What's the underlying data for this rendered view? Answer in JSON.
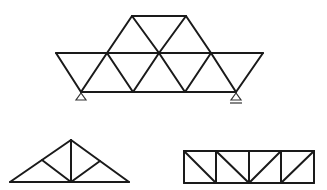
{
  "diagram": {
    "title": "",
    "stroke_color": "#1a1a1a",
    "support_color": "#333333",
    "background": "#ffffff",
    "trusses": [
      {
        "name": "warren-truss-with-supports",
        "members": [
          [
            56,
            53,
            263,
            53
          ],
          [
            132,
            16,
            186,
            16
          ],
          [
            81,
            92,
            236,
            92
          ],
          [
            56,
            53,
            81,
            92
          ],
          [
            81,
            92,
            107,
            53
          ],
          [
            107,
            53,
            133,
            92
          ],
          [
            133,
            92,
            159,
            53
          ],
          [
            159,
            53,
            185,
            92
          ],
          [
            185,
            92,
            211,
            53
          ],
          [
            211,
            53,
            236,
            92
          ],
          [
            236,
            92,
            263,
            53
          ],
          [
            107,
            53,
            132,
            16
          ],
          [
            132,
            16,
            159,
            53
          ],
          [
            159,
            53,
            186,
            16
          ],
          [
            186,
            16,
            211,
            53
          ]
        ],
        "supports": [
          {
            "type": "pin",
            "x": 81,
            "y": 92
          },
          {
            "type": "roller",
            "x": 236,
            "y": 92
          }
        ]
      },
      {
        "name": "roof-truss",
        "members": [
          [
            10,
            182,
            129,
            182
          ],
          [
            10,
            182,
            71,
            140
          ],
          [
            71,
            140,
            129,
            182
          ],
          [
            71,
            140,
            71,
            182
          ],
          [
            42,
            160,
            71,
            182
          ],
          [
            100,
            161,
            71,
            182
          ]
        ],
        "supports": []
      },
      {
        "name": "pratt-truss",
        "members": [
          [
            184,
            151,
            314,
            151
          ],
          [
            184,
            183,
            314,
            183
          ],
          [
            184,
            151,
            184,
            183
          ],
          [
            216,
            151,
            216,
            183
          ],
          [
            249,
            151,
            249,
            183
          ],
          [
            281,
            151,
            281,
            183
          ],
          [
            314,
            151,
            314,
            183
          ],
          [
            184,
            151,
            216,
            183
          ],
          [
            216,
            151,
            249,
            183
          ],
          [
            249,
            183,
            281,
            151
          ],
          [
            281,
            183,
            314,
            151
          ]
        ],
        "supports": []
      }
    ]
  }
}
